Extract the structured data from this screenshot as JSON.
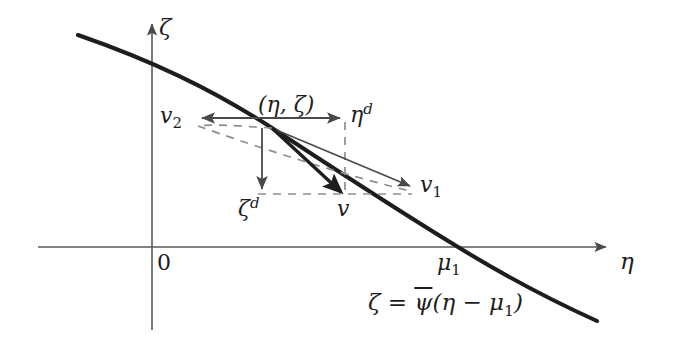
{
  "figure": {
    "background_color": "#ffffff",
    "ink_color": "#1d1d1d",
    "axis_color": "#4a4a4a",
    "dashed_color": "#8a8a8a",
    "width": 674,
    "height": 348
  },
  "axes": {
    "x_axis": {
      "label": "η",
      "name": "eta",
      "y_pixel": 247,
      "x_start": 38,
      "x_end": 612,
      "arrow": "right"
    },
    "y_axis": {
      "label": "ζ",
      "name": "zeta",
      "x_pixel": 152,
      "y_start": 18,
      "y_end": 330,
      "arrow": "up"
    },
    "origin_label": "0"
  },
  "curve": {
    "equation_zeta": "ζ",
    "equation_equals": "=",
    "equation_psi": "ψ",
    "equation_rest": "(η − μ",
    "equation_sub": "1",
    "equation_close": ")",
    "equation_plain": "ζ = ψ̄(η − μ₁)",
    "x_intercept_label": "μ",
    "x_intercept_sub": "1",
    "description": "monotone decreasing concave curve crossing the η-axis at μ₁"
  },
  "point": {
    "label_open": "(",
    "label_eta": "η",
    "label_comma": ", ",
    "label_zeta": "ζ",
    "label_close": ")",
    "label_plain": "(η, ζ)",
    "x": 272,
    "y": 128
  },
  "vectors": [
    {
      "name": "v2",
      "label_base": "v",
      "label_sub": "2",
      "label_plain": "v₂",
      "style": "thin-solid",
      "direction": "left",
      "from": [
        272,
        128
      ],
      "to": [
        196,
        118
      ]
    },
    {
      "name": "v1",
      "label_base": "v",
      "label_sub": "1",
      "label_plain": "v₁",
      "style": "thin-solid",
      "direction": "down-right",
      "from": [
        272,
        128
      ],
      "to": [
        415,
        188
      ]
    },
    {
      "name": "v",
      "label_base": "v",
      "label_sub": "",
      "label_plain": "v",
      "style": "thick-solid",
      "direction": "down-right",
      "from": [
        272,
        128
      ],
      "to": [
        345,
        196
      ]
    },
    {
      "name": "eta-d",
      "label_base": "η",
      "label_sup": "d",
      "label_plain": "ηᵈ",
      "style": "thin-solid",
      "direction": "right",
      "from": [
        272,
        118
      ],
      "to": [
        345,
        118
      ]
    },
    {
      "name": "zeta-d",
      "label_base": "ζ",
      "label_sup": "d",
      "label_plain": "ζᵈ",
      "style": "thin-solid",
      "direction": "down",
      "from": [
        262,
        128
      ],
      "to": [
        262,
        194
      ]
    }
  ],
  "guides": [
    {
      "name": "horizontal-dashed-guide",
      "from": [
        262,
        194
      ],
      "to": [
        412,
        194
      ]
    },
    {
      "name": "vertical-dashed-guide",
      "from": [
        345,
        120
      ],
      "to": [
        345,
        196
      ]
    },
    {
      "name": "diagonal-dashed-guide",
      "from": [
        272,
        128
      ],
      "to": [
        196,
        125
      ]
    },
    {
      "name": "diagonal-dashed-to-v1",
      "from": [
        196,
        125
      ],
      "to": [
        412,
        192
      ]
    }
  ]
}
